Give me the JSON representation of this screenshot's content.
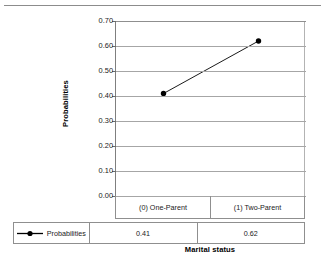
{
  "chart_data": {
    "type": "line",
    "title": "",
    "xlabel": "Marital status",
    "ylabel": "Probabilities",
    "categories": [
      "(0) One-Parent",
      "(1) Two-Parent"
    ],
    "series": [
      {
        "name": "Probabilities",
        "values": [
          0.41,
          0.62
        ],
        "marker": "filled-circle",
        "color": "#000000"
      }
    ],
    "ylim": [
      0.0,
      0.7
    ],
    "ytick_labels": [
      "0.70",
      "0.60",
      "0.50",
      "0.40",
      "0.30",
      "0.20",
      "0.10",
      "0.00"
    ],
    "ytick_values": [
      0.7,
      0.6,
      0.5,
      0.4,
      0.3,
      0.2,
      0.1,
      0.0
    ],
    "grid": "horizontal",
    "legend_position": "bottom-table",
    "data_table": {
      "row_label": "Probabilities",
      "columns": [
        "(0) One-Parent",
        "(1) Two-Parent"
      ],
      "values": [
        "0.41",
        "0.62"
      ]
    }
  },
  "colors": {
    "series": "#000000",
    "gridline": "#a6a6a6",
    "axis": "#7f7f7f",
    "table_border": "#8f8f8f",
    "text": "#1a1a1a"
  }
}
